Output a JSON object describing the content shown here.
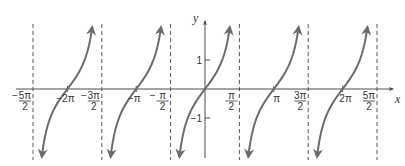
{
  "chart_data": {
    "type": "line",
    "title": "",
    "function": "y = tan x",
    "xlabel": "x",
    "ylabel": "y",
    "xlim": [
      -2.6,
      2.65
    ],
    "ylim": [
      -2.3,
      2.2
    ],
    "grid": false,
    "x_unit": "pi",
    "x_ticks": [
      {
        "value": -2.5,
        "label": "-5π/2",
        "num": "5π",
        "den": "2",
        "neg": true
      },
      {
        "value": -2.0,
        "label": "-2π"
      },
      {
        "value": -1.5,
        "label": "-3π/2",
        "num": "3π",
        "den": "2",
        "neg": true
      },
      {
        "value": -1.0,
        "label": "-π"
      },
      {
        "value": -0.5,
        "label": "-π/2",
        "num": "π",
        "den": "2",
        "neg": true
      },
      {
        "value": 0.5,
        "label": "π/2",
        "num": "π",
        "den": "2",
        "neg": false
      },
      {
        "value": 1.0,
        "label": "π"
      },
      {
        "value": 1.5,
        "label": "3π/2",
        "num": "3π",
        "den": "2",
        "neg": false
      },
      {
        "value": 2.0,
        "label": "2π"
      },
      {
        "value": 2.5,
        "label": "5π/2",
        "num": "5π",
        "den": "2",
        "neg": false
      }
    ],
    "y_ticks": [
      {
        "value": 1,
        "label": "1"
      },
      {
        "value": -1,
        "label": "−1"
      }
    ],
    "asymptotes_x_pi": [
      -2.5,
      -1.5,
      -0.5,
      0.5,
      1.5,
      2.5
    ],
    "zeros_x_pi": [
      -2,
      -1,
      0,
      1,
      2
    ],
    "branches": [
      {
        "from_pi": -2.5,
        "to_pi": -1.5
      },
      {
        "from_pi": -1.5,
        "to_pi": -0.5
      },
      {
        "from_pi": -0.5,
        "to_pi": 0.5
      },
      {
        "from_pi": 0.5,
        "to_pi": 1.5
      },
      {
        "from_pi": 1.5,
        "to_pi": 2.5
      }
    ],
    "colors": {
      "curve": "#6b6b6b",
      "axis": "#4a4a4a",
      "asymptote": "#555555",
      "text": "#333333"
    }
  },
  "axis_labels": {
    "x": "x",
    "y": "y"
  },
  "layout": {
    "origin_px": [
      205,
      89
    ],
    "px_per_pi": 68.8,
    "px_per_unit_y": 29,
    "curve_y_top": 27,
    "curve_y_bottom": 157
  }
}
